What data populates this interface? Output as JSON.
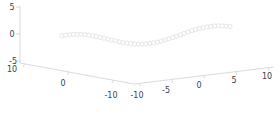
{
  "chart_data": {
    "type": "scatter",
    "projection": "3d",
    "title": "",
    "background_color": "#ffffff",
    "axis_line_color": "#d6d6d6",
    "tick_label_color": "#404040",
    "x_axis": {
      "ticks": [
        "10",
        "0",
        "-10"
      ],
      "range": [
        -10,
        10
      ]
    },
    "y_axis": {
      "ticks": [
        "-10",
        "-5",
        "0",
        "5",
        "10"
      ],
      "range": [
        -10,
        10
      ]
    },
    "z_axis": {
      "ticks": [
        "5",
        "0",
        "-5"
      ],
      "range": [
        -5,
        5
      ]
    },
    "series": [
      {
        "name": "wave-curve",
        "marker": "open-circle",
        "marker_color": "#dedede",
        "x_const": 0,
        "y": [
          -10,
          -9.55,
          -9.09,
          -8.64,
          -8.18,
          -7.73,
          -7.27,
          -6.82,
          -6.36,
          -5.91,
          -5.45,
          -5,
          -4.55,
          -4.09,
          -3.64,
          -3.18,
          -2.73,
          -2.27,
          -1.82,
          -1.36,
          -0.91,
          -0.45,
          0,
          0.45,
          0.91,
          1.36,
          1.82,
          2.27,
          2.73,
          3.18,
          3.64,
          4.09,
          4.55,
          5,
          5.45,
          5.91,
          6.36,
          6.82,
          7.27,
          7.73,
          8.18,
          8.64,
          9.09,
          9.55,
          10
        ],
        "z": [
          1.34,
          1.43,
          1.49,
          1.5,
          1.47,
          1.4,
          1.29,
          1.14,
          0.96,
          0.75,
          0.53,
          0.29,
          0.04,
          -0.22,
          -0.46,
          -0.7,
          -0.91,
          -1.09,
          -1.24,
          -1.37,
          -1.45,
          -1.49,
          -1.49,
          -1.45,
          -1.37,
          -1.25,
          -1.09,
          -0.9,
          -0.68,
          -0.45,
          -0.21,
          0.05,
          0.3,
          0.54,
          0.77,
          0.97,
          1.15,
          1.29,
          1.4,
          1.47,
          1.5,
          1.49,
          1.43,
          1.33,
          1.2
        ]
      }
    ]
  }
}
